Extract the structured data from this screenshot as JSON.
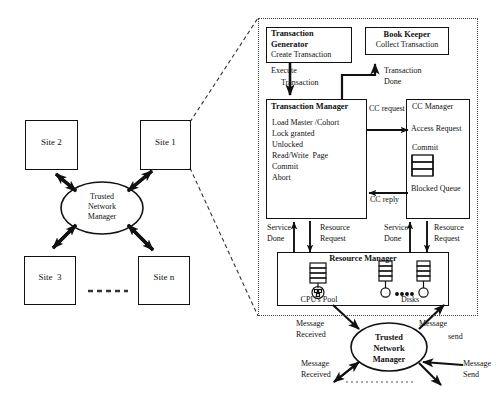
{
  "diagram": {
    "left_panel": {
      "sites": [
        {
          "id": "site2",
          "label": "Site 2"
        },
        {
          "id": "site1",
          "label": "Site 1"
        },
        {
          "id": "site3",
          "label": "Site  3"
        },
        {
          "id": "siten",
          "label": "Site n"
        }
      ],
      "hub": {
        "label_lines": [
          "Trusted",
          "Network",
          "Manager"
        ]
      },
      "ellipsis_separator": "- - - - - -"
    },
    "right_panel": {
      "transaction_generator": {
        "title_lines": [
          "Transaction",
          "Generator"
        ],
        "body": "Create Transaction"
      },
      "book_keeper": {
        "title": "Book Keeper",
        "body": "Collect Transaction"
      },
      "transaction_manager": {
        "title": "Transaction Manager",
        "items": [
          "Load Master /Cohort",
          "Lock granted",
          "Unlocked",
          "Read/Write  Page",
          "Commit",
          "Abort"
        ]
      },
      "cc_manager": {
        "title": "CC Manager",
        "access_request": "Access Request",
        "commit": "Commit",
        "blocked_queue": "Blocked Queue"
      },
      "resource_manager": {
        "title": "Resource Manager",
        "cpu_pool": "CPU's Pool",
        "disks": "Disks",
        "disks_ellipsis": "..."
      },
      "arrow_labels": {
        "execute": "Execute",
        "execute_2": "Transaction",
        "transaction_done_1": "Transaction",
        "transaction_done_2": "Done",
        "cc_request": "CC request",
        "cc_reply": "CC reply",
        "service_done_1": "Service",
        "service_done_2": "Done",
        "resource_request_1": "Resource",
        "resource_request_2": "Request",
        "service_done_r1": "Service",
        "service_done_r2": "Done",
        "resource_request_r1": "Resource",
        "resource_request_r2": "Request"
      }
    },
    "bottom_hub": {
      "label_lines": [
        "Trusted",
        "Network",
        "Manager"
      ],
      "labels": {
        "msg_received_top_1": "Message",
        "msg_received_top_2": "Received",
        "msg_send_top_1": "Message",
        "msg_send_top_2": "send",
        "msg_received_bottom_1": "Message",
        "msg_received_bottom_2": "Received",
        "msg_send_bottom_1": "Message",
        "msg_send_bottom_2": "Send"
      }
    },
    "colors": {
      "stroke": "#111111",
      "dash": "#444444",
      "background": "#ffffff"
    }
  }
}
